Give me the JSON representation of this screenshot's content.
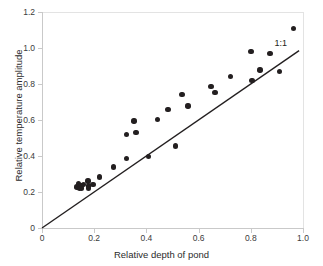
{
  "chart_data": {
    "type": "scatter",
    "title": "",
    "xlabel": "Relative depth of pond",
    "ylabel": "Relative temperature amplitude",
    "xlim": [
      0,
      1.0
    ],
    "ylim": [
      0,
      1.2
    ],
    "xticks": [
      "0",
      "0.2",
      "0.4",
      "0.6",
      "0.8",
      "1.0"
    ],
    "xtick_values": [
      0,
      0.2,
      0.4,
      0.6,
      0.8,
      1.0
    ],
    "yticks": [
      "0",
      "0.2",
      "0.4",
      "0.6",
      "0.8",
      "1.0",
      "1.2"
    ],
    "ytick_values": [
      0,
      0.2,
      0.4,
      0.6,
      0.8,
      1.0,
      1.2
    ],
    "grid": false,
    "legend": "none",
    "marker_color": "#231f20",
    "line_color": "#231f20",
    "axis_color": "#c9c9c9",
    "annotations": [
      {
        "text": "1:1",
        "x": 0.925,
        "y": 1.02
      }
    ],
    "reference_line": {
      "label": "1:1",
      "x": [
        0,
        0.985
      ],
      "y": [
        0,
        0.985
      ]
    },
    "series": [
      {
        "name": "Ponds",
        "points": [
          {
            "x": 0.134,
            "y": 0.228
          },
          {
            "x": 0.14,
            "y": 0.245
          },
          {
            "x": 0.143,
            "y": 0.219
          },
          {
            "x": 0.15,
            "y": 0.236
          },
          {
            "x": 0.152,
            "y": 0.222
          },
          {
            "x": 0.158,
            "y": 0.243
          },
          {
            "x": 0.176,
            "y": 0.262
          },
          {
            "x": 0.178,
            "y": 0.233
          },
          {
            "x": 0.179,
            "y": 0.222
          },
          {
            "x": 0.196,
            "y": 0.241
          },
          {
            "x": 0.221,
            "y": 0.283
          },
          {
            "x": 0.273,
            "y": 0.338
          },
          {
            "x": 0.323,
            "y": 0.386
          },
          {
            "x": 0.324,
            "y": 0.521
          },
          {
            "x": 0.352,
            "y": 0.594
          },
          {
            "x": 0.36,
            "y": 0.529
          },
          {
            "x": 0.408,
            "y": 0.396
          },
          {
            "x": 0.443,
            "y": 0.604
          },
          {
            "x": 0.482,
            "y": 0.659
          },
          {
            "x": 0.511,
            "y": 0.455
          },
          {
            "x": 0.537,
            "y": 0.743
          },
          {
            "x": 0.559,
            "y": 0.678
          },
          {
            "x": 0.648,
            "y": 0.786
          },
          {
            "x": 0.663,
            "y": 0.753
          },
          {
            "x": 0.722,
            "y": 0.843
          },
          {
            "x": 0.801,
            "y": 0.982
          },
          {
            "x": 0.805,
            "y": 0.821
          },
          {
            "x": 0.835,
            "y": 0.877
          },
          {
            "x": 0.874,
            "y": 0.971
          },
          {
            "x": 0.911,
            "y": 0.868
          },
          {
            "x": 0.963,
            "y": 1.11
          }
        ]
      }
    ]
  }
}
